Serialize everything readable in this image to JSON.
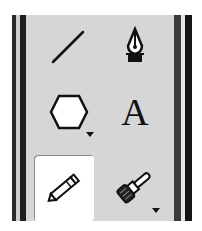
{
  "toolbar": {
    "tools": [
      {
        "id": "line",
        "icon": "line-icon",
        "selected": false,
        "has_flyout": false
      },
      {
        "id": "pen",
        "icon": "pen-nib-icon",
        "selected": false,
        "has_flyout": false
      },
      {
        "id": "polygon",
        "icon": "hexagon-icon",
        "selected": false,
        "has_flyout": true
      },
      {
        "id": "text",
        "icon": "text-icon",
        "glyph": "A",
        "selected": false,
        "has_flyout": false
      },
      {
        "id": "pencil",
        "icon": "pencil-icon",
        "selected": true,
        "has_flyout": false
      },
      {
        "id": "brush",
        "icon": "paintbrush-icon",
        "selected": false,
        "has_flyout": true
      }
    ]
  },
  "colors": {
    "panel": "#d6d6d6",
    "rail": "#1e1e1e",
    "selected_bg": "#ffffff",
    "icon": "#111111"
  }
}
